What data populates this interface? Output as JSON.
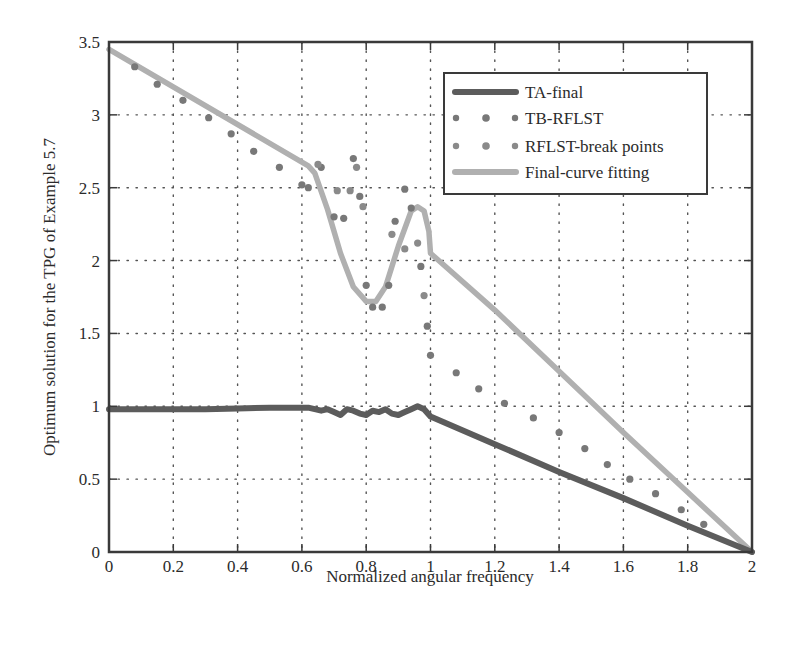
{
  "chart_data": {
    "type": "line",
    "title": "",
    "xlabel": "Normalized angular frequency",
    "ylabel": "Optimum solution for the TPG of Example 5.7",
    "xlim": [
      0,
      2
    ],
    "ylim": [
      0,
      3.5
    ],
    "x_ticks": [
      0,
      0.2,
      0.4,
      0.6,
      0.8,
      1,
      1.2,
      1.4,
      1.6,
      1.8,
      2
    ],
    "x_tick_labels": [
      "0",
      "0.2",
      "0.4",
      "0.6",
      "0.8",
      "1",
      "1.2",
      "1.4",
      "1.6",
      "1.8",
      "2"
    ],
    "y_ticks": [
      0,
      0.5,
      1,
      1.5,
      2,
      2.5,
      3,
      3.5
    ],
    "y_tick_labels": [
      "0",
      "0.5",
      "1",
      "1.5",
      "2",
      "2.5",
      "3",
      "3.5"
    ],
    "grid": true,
    "legend_position": "upper right",
    "series": [
      {
        "name": "TA-final",
        "style": "line",
        "color": "#5c5c5c",
        "x": [
          0,
          0.1,
          0.2,
          0.3,
          0.4,
          0.5,
          0.6,
          0.62,
          0.66,
          0.68,
          0.7,
          0.72,
          0.74,
          0.76,
          0.78,
          0.8,
          0.82,
          0.84,
          0.86,
          0.88,
          0.9,
          0.92,
          0.94,
          0.96,
          0.98,
          1.0,
          1.2,
          1.4,
          1.6,
          1.8,
          2.0
        ],
        "y": [
          0.98,
          0.98,
          0.98,
          0.98,
          0.985,
          0.99,
          0.99,
          0.99,
          0.97,
          0.98,
          0.96,
          0.94,
          0.98,
          0.97,
          0.95,
          0.94,
          0.97,
          0.96,
          0.98,
          0.95,
          0.94,
          0.96,
          0.98,
          1.0,
          0.98,
          0.93,
          0.74,
          0.55,
          0.37,
          0.18,
          0.0
        ]
      },
      {
        "name": "TB-RFLST",
        "style": "dots",
        "color": "#787878",
        "x": [
          0.08,
          0.15,
          0.23,
          0.31,
          0.38,
          0.45,
          0.53,
          0.6,
          0.62,
          0.66,
          0.7,
          0.73,
          0.76,
          0.78,
          0.8,
          0.82,
          0.85,
          0.87,
          0.89,
          0.92,
          0.94,
          0.97,
          0.99,
          1.0,
          1.08,
          1.15,
          1.23,
          1.32,
          1.4,
          1.48,
          1.55,
          1.62,
          1.7,
          1.78,
          1.85
        ],
        "y": [
          3.33,
          3.21,
          3.1,
          2.98,
          2.87,
          2.75,
          2.64,
          2.52,
          2.5,
          2.64,
          2.3,
          2.29,
          2.7,
          2.44,
          1.83,
          1.68,
          1.68,
          1.83,
          2.27,
          2.49,
          2.36,
          1.96,
          1.55,
          1.35,
          1.23,
          1.12,
          1.02,
          0.92,
          0.82,
          0.71,
          0.6,
          0.5,
          0.4,
          0.29,
          0.19
        ]
      },
      {
        "name": "RFLST-break points",
        "style": "dots",
        "color": "#8a8a8a",
        "x": [
          0.65,
          0.71,
          0.75,
          0.77,
          0.79,
          0.88,
          0.92,
          0.96,
          0.98
        ],
        "y": [
          2.66,
          2.48,
          2.48,
          2.64,
          2.37,
          2.18,
          2.08,
          2.12,
          1.76
        ]
      },
      {
        "name": "Final-curve fitting",
        "style": "line",
        "color": "#b0b0b0",
        "x": [
          0,
          0.62,
          0.64,
          0.68,
          0.72,
          0.76,
          0.8,
          0.83,
          0.86,
          0.9,
          0.94,
          0.96,
          0.98,
          0.995,
          1.0,
          1.2,
          1.4,
          1.6,
          1.8,
          2.0
        ],
        "y": [
          3.45,
          2.65,
          2.6,
          2.35,
          2.05,
          1.82,
          1.72,
          1.72,
          1.82,
          2.1,
          2.34,
          2.37,
          2.34,
          2.2,
          2.05,
          1.66,
          1.24,
          0.82,
          0.41,
          0.0
        ]
      }
    ]
  },
  "legend": {
    "items": [
      {
        "label": "TA-final"
      },
      {
        "label": "TB-RFLST"
      },
      {
        "label": "RFLST-break points"
      },
      {
        "label": "Final-curve fitting"
      }
    ]
  },
  "colors": {
    "axis": "#3a3a3a",
    "grid": "#555555",
    "ta_final": "#5c5c5c",
    "tb_rflst": "#787878",
    "break_points": "#8a8a8a",
    "final_curve": "#b0b0b0"
  }
}
